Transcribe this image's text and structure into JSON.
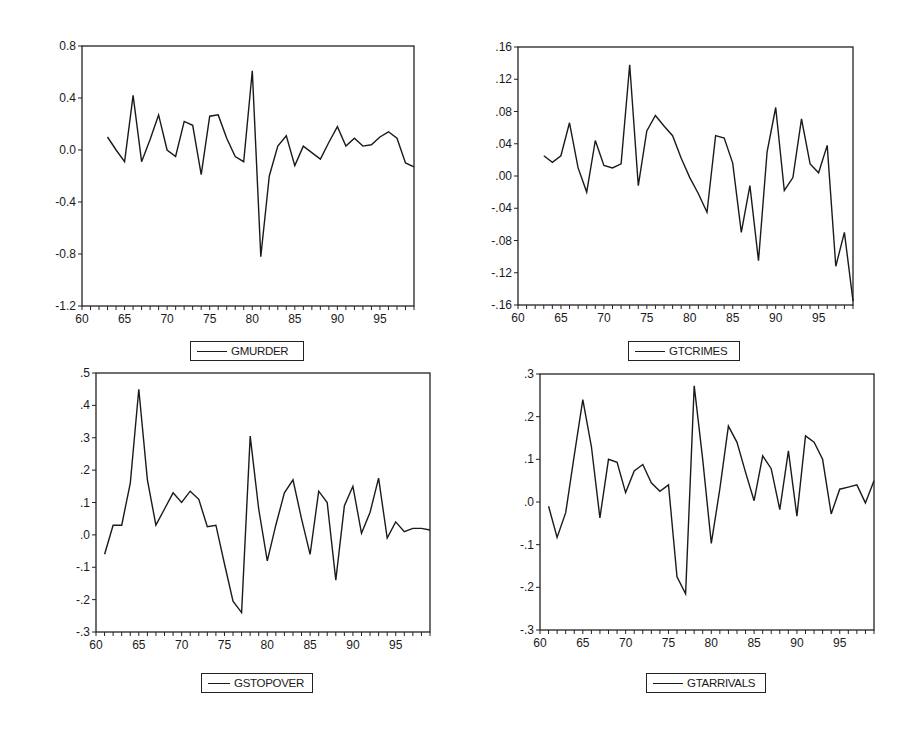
{
  "chart_data": [
    {
      "type": "line",
      "title": "",
      "series_name": "GMURDER",
      "xlabel": "",
      "ylabel": "",
      "xlim": [
        60,
        99
      ],
      "ylim": [
        -1.2,
        0.8
      ],
      "xticks": [
        "60",
        "65",
        "70",
        "75",
        "80",
        "85",
        "90",
        "95"
      ],
      "yticks": [
        "0.8",
        "0.4",
        "0.0",
        "-0.4",
        "-0.8",
        "-1.2"
      ],
      "grid": false,
      "legend_position": "bottom",
      "x": [
        63,
        64,
        65,
        66,
        67,
        68,
        69,
        70,
        71,
        72,
        73,
        74,
        75,
        76,
        77,
        78,
        79,
        80,
        81,
        82,
        83,
        84,
        85,
        86,
        87,
        88,
        89,
        90,
        91,
        92,
        93,
        94,
        95,
        96,
        97,
        98,
        99
      ],
      "values": [
        0.1,
        0.0,
        -0.09,
        0.42,
        -0.09,
        0.08,
        0.27,
        0.0,
        -0.05,
        0.22,
        0.19,
        -0.19,
        0.26,
        0.27,
        0.09,
        -0.05,
        -0.09,
        0.61,
        -0.82,
        -0.2,
        0.03,
        0.11,
        -0.12,
        0.03,
        -0.02,
        -0.07,
        0.06,
        0.18,
        0.03,
        0.09,
        0.03,
        0.04,
        0.1,
        0.14,
        0.09,
        -0.1,
        -0.13
      ]
    },
    {
      "type": "line",
      "title": "",
      "series_name": "GTCRIMES",
      "xlabel": "",
      "ylabel": "",
      "xlim": [
        60,
        99
      ],
      "ylim": [
        -0.16,
        0.16
      ],
      "xticks": [
        "60",
        "65",
        "70",
        "75",
        "80",
        "85",
        "90",
        "95"
      ],
      "yticks": [
        ".16",
        ".12",
        ".08",
        ".04",
        ".00",
        "-.04",
        "-.08",
        "-.12",
        "-.16"
      ],
      "grid": false,
      "legend_position": "bottom",
      "x": [
        63,
        64,
        65,
        66,
        67,
        68,
        69,
        70,
        71,
        72,
        73,
        74,
        75,
        76,
        77,
        78,
        79,
        80,
        81,
        82,
        83,
        84,
        85,
        86,
        87,
        88,
        89,
        90,
        91,
        92,
        93,
        94,
        95,
        96,
        97,
        98,
        99
      ],
      "values": [
        0.025,
        0.017,
        0.025,
        0.066,
        0.01,
        -0.02,
        0.044,
        0.013,
        0.01,
        0.015,
        0.138,
        -0.012,
        0.056,
        0.075,
        0.062,
        0.05,
        0.022,
        -0.002,
        -0.022,
        -0.045,
        0.05,
        0.047,
        0.016,
        -0.07,
        -0.012,
        -0.105,
        0.03,
        0.085,
        -0.018,
        -0.002,
        0.071,
        0.015,
        0.004,
        0.038,
        -0.112,
        -0.07,
        -0.155
      ]
    },
    {
      "type": "line",
      "title": "",
      "series_name": "GSTOPOVER",
      "xlabel": "",
      "ylabel": "",
      "xlim": [
        60,
        99
      ],
      "ylim": [
        -0.3,
        0.5
      ],
      "xticks": [
        "60",
        "65",
        "70",
        "75",
        "80",
        "85",
        "90",
        "95"
      ],
      "yticks": [
        ".5",
        ".4",
        ".3",
        ".2",
        ".1",
        ".0",
        "-.1",
        "-.2",
        "-.3"
      ],
      "grid": false,
      "legend_position": "bottom",
      "x": [
        61,
        62,
        63,
        64,
        65,
        66,
        67,
        68,
        69,
        70,
        71,
        72,
        73,
        74,
        75,
        76,
        77,
        78,
        79,
        80,
        81,
        82,
        83,
        84,
        85,
        86,
        87,
        88,
        89,
        90,
        91,
        92,
        93,
        94,
        95,
        96,
        97,
        98,
        99
      ],
      "values": [
        -0.06,
        0.03,
        0.03,
        0.16,
        0.45,
        0.17,
        0.03,
        0.08,
        0.13,
        0.1,
        0.135,
        0.11,
        0.025,
        0.03,
        -0.09,
        -0.205,
        -0.24,
        0.305,
        0.08,
        -0.08,
        0.03,
        0.13,
        0.17,
        0.05,
        -0.06,
        0.135,
        0.1,
        -0.14,
        0.09,
        0.15,
        0.005,
        0.07,
        0.175,
        -0.01,
        0.04,
        0.01,
        0.02,
        0.02,
        0.015
      ]
    },
    {
      "type": "line",
      "title": "",
      "series_name": "GTARRIVALS",
      "xlabel": "",
      "ylabel": "",
      "xlim": [
        60,
        99
      ],
      "ylim": [
        -0.3,
        0.3
      ],
      "xticks": [
        "60",
        "65",
        "70",
        "75",
        "80",
        "85",
        "90",
        "95"
      ],
      "yticks": [
        ".3",
        ".2",
        ".1",
        ".0",
        "-.1",
        "-.2",
        "-.3"
      ],
      "grid": false,
      "legend_position": "bottom",
      "x": [
        61,
        62,
        63,
        64,
        65,
        66,
        67,
        68,
        69,
        70,
        71,
        72,
        73,
        74,
        75,
        76,
        77,
        78,
        79,
        80,
        81,
        82,
        83,
        84,
        85,
        86,
        87,
        88,
        89,
        90,
        91,
        92,
        93,
        94,
        95,
        96,
        97,
        98,
        99
      ],
      "values": [
        -0.01,
        -0.083,
        -0.025,
        0.11,
        0.24,
        0.13,
        -0.037,
        0.1,
        0.093,
        0.022,
        0.073,
        0.088,
        0.045,
        0.025,
        0.04,
        -0.175,
        -0.215,
        0.272,
        0.1,
        -0.097,
        0.03,
        0.178,
        0.14,
        0.07,
        0.003,
        0.108,
        0.078,
        -0.018,
        0.12,
        -0.033,
        0.155,
        0.14,
        0.1,
        -0.028,
        0.03,
        0.035,
        0.04,
        -0.002,
        0.05
      ]
    }
  ],
  "legends": {
    "chart1": "GMURDER",
    "chart2": "GTCRIMES",
    "chart3": "GSTOPOVER",
    "chart4": "GTARRIVALS"
  },
  "colors": {
    "line": "#1a1a1a",
    "frame": "#222222",
    "background": "#ffffff"
  }
}
